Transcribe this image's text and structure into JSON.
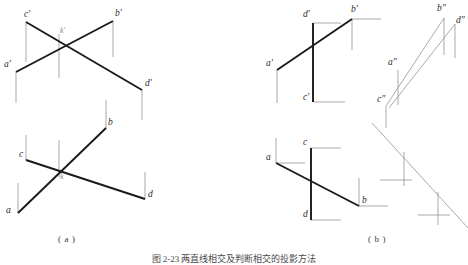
{
  "figure": {
    "caption": "图 2-23  两直线相交及判断相交的投影方法",
    "panels": [
      {
        "id": "a",
        "label": "( a )"
      },
      {
        "id": "b",
        "label": "( b )"
      }
    ]
  },
  "colors": {
    "heavy_line": "#1a1a1a",
    "light_line": "#9a9a9a",
    "label_text": "#2b2b2b",
    "faint_text": "#8a8a8a",
    "background": "#ffffff"
  },
  "panel_a": {
    "upper_view": {
      "name": "frontal-projection",
      "points": [
        {
          "name": "c-prime",
          "label": "c′",
          "x": 24,
          "y": 16
        },
        {
          "name": "b-prime",
          "label": "b′",
          "x": 115,
          "y": 15
        },
        {
          "name": "a-prime",
          "label": "a′",
          "x": 12,
          "y": 66
        },
        {
          "name": "d-prime",
          "label": "d′",
          "x": 145,
          "y": 85
        },
        {
          "name": "k-prime",
          "label": "k′",
          "x": 60,
          "y": 33
        }
      ]
    },
    "lower_view": {
      "name": "horizontal-projection",
      "points": [
        {
          "name": "b-point",
          "label": "b",
          "x": 110,
          "y": 124
        },
        {
          "name": "c-point",
          "label": "c",
          "x": 24,
          "y": 156
        },
        {
          "name": "d-point",
          "label": "d",
          "x": 148,
          "y": 195
        },
        {
          "name": "a-point",
          "label": "a",
          "x": 12,
          "y": 211
        },
        {
          "name": "k-point",
          "label": "k",
          "x": 60,
          "y": 179
        }
      ]
    }
  },
  "panel_b": {
    "upper_left_view": {
      "name": "frontal-projection",
      "points": [
        {
          "name": "d-prime",
          "label": "d′",
          "x": 312,
          "y": 16
        },
        {
          "name": "b-prime",
          "label": "b′",
          "x": 355,
          "y": 10
        },
        {
          "name": "a-prime",
          "label": "a′",
          "x": 273,
          "y": 65
        },
        {
          "name": "c-prime",
          "label": "c′",
          "x": 308,
          "y": 98
        }
      ]
    },
    "upper_right_view": {
      "name": "profile-projection",
      "points": [
        {
          "name": "b-double-prime",
          "label": "b″",
          "x": 444,
          "y": 10
        },
        {
          "name": "d-double-prime",
          "label": "d″",
          "x": 458,
          "y": 22
        },
        {
          "name": "a-double-prime",
          "label": "a″",
          "x": 395,
          "y": 64
        },
        {
          "name": "c-double-prime",
          "label": "c″",
          "x": 382,
          "y": 100
        }
      ]
    },
    "lower_left_view": {
      "name": "horizontal-projection",
      "points": [
        {
          "name": "c-point",
          "label": "c",
          "x": 306,
          "y": 144
        },
        {
          "name": "a-point",
          "label": "a",
          "x": 270,
          "y": 159
        },
        {
          "name": "b-point",
          "label": "b",
          "x": 362,
          "y": 202
        },
        {
          "name": "d-point",
          "label": "d",
          "x": 310,
          "y": 216
        }
      ]
    }
  },
  "geometry": {
    "panel_a_upper": {
      "heavy_segments": [
        {
          "name": "segment-c-prime-d-prime",
          "x1": 26,
          "y1": 22,
          "x2": 142,
          "y2": 90
        },
        {
          "name": "segment-a-prime-b-prime",
          "x1": 16,
          "y1": 72,
          "x2": 113,
          "y2": 21
        }
      ],
      "light_segments": [
        {
          "name": "projector-c-prime",
          "x1": 26,
          "y1": 22,
          "x2": 26,
          "y2": 62
        },
        {
          "name": "projector-b-prime",
          "x1": 113,
          "y1": 21,
          "x2": 113,
          "y2": 57
        },
        {
          "name": "projector-a-prime",
          "x1": 16,
          "y1": 72,
          "x2": 16,
          "y2": 103
        },
        {
          "name": "projector-d-prime",
          "x1": 142,
          "y1": 90,
          "x2": 142,
          "y2": 120
        },
        {
          "name": "projector-k-prime",
          "x1": 59,
          "y1": 34,
          "x2": 59,
          "y2": 78
        }
      ]
    },
    "panel_a_lower": {
      "heavy_segments": [
        {
          "name": "segment-a-b",
          "x1": 18,
          "y1": 213,
          "x2": 106,
          "y2": 128
        },
        {
          "name": "segment-c-d",
          "x1": 26,
          "y1": 160,
          "x2": 145,
          "y2": 199
        }
      ],
      "light_segments": [
        {
          "name": "projector-c",
          "x1": 26,
          "y1": 160,
          "x2": 26,
          "y2": 135
        },
        {
          "name": "projector-a",
          "x1": 18,
          "y1": 213,
          "x2": 18,
          "y2": 183
        },
        {
          "name": "projector-b",
          "x1": 106,
          "y1": 128,
          "x2": 106,
          "y2": 100
        },
        {
          "name": "projector-d",
          "x1": 145,
          "y1": 199,
          "x2": 145,
          "y2": 172
        },
        {
          "name": "projector-k",
          "x1": 59,
          "y1": 177,
          "x2": 59,
          "y2": 140
        }
      ]
    },
    "panel_b_upper_left": {
      "heavy_segments": [
        {
          "name": "segment-a-prime-b-prime",
          "x1": 277,
          "y1": 70,
          "x2": 352,
          "y2": 19
        },
        {
          "name": "segment-d-prime-c-prime",
          "x1": 313,
          "y1": 23,
          "x2": 313,
          "y2": 102
        }
      ],
      "light_segments": [
        {
          "name": "projector-d-prime-h",
          "x1": 313,
          "y1": 23,
          "x2": 341,
          "y2": 23
        },
        {
          "name": "projector-b-prime-h",
          "x1": 352,
          "y1": 19,
          "x2": 381,
          "y2": 19
        },
        {
          "name": "projector-b-prime-v",
          "x1": 352,
          "y1": 19,
          "x2": 352,
          "y2": 50
        },
        {
          "name": "projector-a-prime-v",
          "x1": 277,
          "y1": 70,
          "x2": 277,
          "y2": 103
        },
        {
          "name": "projector-c-prime-h",
          "x1": 313,
          "y1": 102,
          "x2": 345,
          "y2": 102
        }
      ]
    },
    "panel_b_upper_right": {
      "light_segments": [
        {
          "name": "line-c-double-prime-b-double-prime",
          "x1": 386,
          "y1": 106,
          "x2": 444,
          "y2": 18
        },
        {
          "name": "line-a-double-prime-d-double-prime",
          "x1": 389,
          "y1": 108,
          "x2": 455,
          "y2": 24
        },
        {
          "name": "projector-b-double-prime-v",
          "x1": 444,
          "y1": 18,
          "x2": 444,
          "y2": 55
        },
        {
          "name": "projector-d-double-prime-v",
          "x1": 455,
          "y1": 24,
          "x2": 455,
          "y2": 58
        },
        {
          "name": "projector-a-double-prime-v",
          "x1": 398,
          "y1": 70,
          "x2": 398,
          "y2": 105
        },
        {
          "name": "projector-c-double-prime-v",
          "x1": 386,
          "y1": 106,
          "x2": 386,
          "y2": 128
        }
      ]
    },
    "panel_b_lower_left": {
      "heavy_segments": [
        {
          "name": "segment-a-b",
          "x1": 276,
          "y1": 163,
          "x2": 359,
          "y2": 206
        },
        {
          "name": "segment-c-d",
          "x1": 311,
          "y1": 148,
          "x2": 311,
          "y2": 220
        }
      ],
      "light_segments": [
        {
          "name": "projector-c-h",
          "x1": 311,
          "y1": 148,
          "x2": 341,
          "y2": 148
        },
        {
          "name": "projector-a-h",
          "x1": 276,
          "y1": 163,
          "x2": 305,
          "y2": 163
        },
        {
          "name": "projector-a-v",
          "x1": 276,
          "y1": 163,
          "x2": 276,
          "y2": 138
        },
        {
          "name": "projector-b-h",
          "x1": 359,
          "y1": 206,
          "x2": 388,
          "y2": 206
        },
        {
          "name": "projector-b-v",
          "x1": 359,
          "y1": 206,
          "x2": 359,
          "y2": 178
        },
        {
          "name": "projector-d-h",
          "x1": 311,
          "y1": 220,
          "x2": 341,
          "y2": 220
        }
      ]
    },
    "panel_b_lower_right": {
      "light_segments": [
        {
          "name": "diagonal-axis",
          "x1": 372,
          "y1": 123,
          "x2": 468,
          "y2": 228
        },
        {
          "name": "tick-upper-v",
          "x1": 404,
          "y1": 152,
          "x2": 404,
          "y2": 186
        },
        {
          "name": "tick-upper-h",
          "x1": 380,
          "y1": 180,
          "x2": 412,
          "y2": 180
        },
        {
          "name": "tick-lower-v",
          "x1": 438,
          "y1": 192,
          "x2": 438,
          "y2": 225
        },
        {
          "name": "tick-lower-h",
          "x1": 418,
          "y1": 215,
          "x2": 450,
          "y2": 215
        }
      ]
    }
  }
}
